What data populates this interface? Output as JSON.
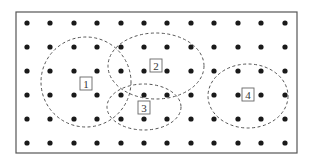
{
  "diagram": {
    "type": "dot-grid-with-clusters",
    "frame": {
      "x": 16,
      "y": 12,
      "width": 281,
      "height": 141,
      "stroke": "#555555"
    },
    "grid": {
      "cols_x": [
        27,
        50,
        74,
        97,
        121,
        144,
        167,
        191,
        214,
        238,
        261,
        285
      ],
      "rows_y": [
        23,
        47,
        71,
        95,
        119,
        143
      ],
      "dot_radius": 2.6,
      "dot_color": "#1a1a1a"
    },
    "clusters": [
      {
        "id": 1,
        "label": "1",
        "cx": 86,
        "cy": 82,
        "rx": 45,
        "ry": 45,
        "label_x": 86,
        "label_y": 84
      },
      {
        "id": 2,
        "label": "2",
        "cx": 156,
        "cy": 66,
        "rx": 48,
        "ry": 33,
        "label_x": 156,
        "label_y": 66
      },
      {
        "id": 3,
        "label": "3",
        "cx": 144,
        "cy": 107,
        "rx": 37,
        "ry": 23,
        "label_x": 144,
        "label_y": 108
      },
      {
        "id": 4,
        "label": "4",
        "cx": 248,
        "cy": 96,
        "rx": 40,
        "ry": 32,
        "label_x": 248,
        "label_y": 95
      }
    ],
    "ellipse_stroke": "#555555",
    "ellipse_dash": "3,2.5"
  }
}
